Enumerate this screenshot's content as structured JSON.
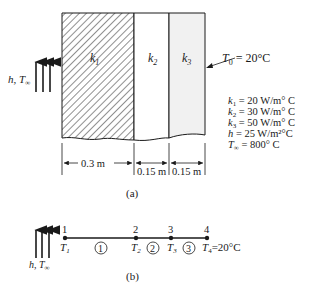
{
  "figure_a": {
    "caption": "(a)",
    "convection_label": "h, T",
    "convection_sub": "∞",
    "layers": [
      {
        "label": "k",
        "sub": "1",
        "thickness": "0.3 m",
        "fill": "hatched"
      },
      {
        "label": "k",
        "sub": "2",
        "thickness": "0.15 m",
        "fill": "white"
      },
      {
        "label": "k",
        "sub": "3",
        "thickness": "0.15 m",
        "fill": "light-gray"
      }
    ],
    "boundary_label": "T",
    "boundary_sub": "0",
    "boundary_value": " = 20°C",
    "properties": [
      {
        "sym": "k",
        "sub": "1",
        "text": " = 20 W/m° C"
      },
      {
        "sym": "k",
        "sub": "2",
        "text": " = 30 W/m° C"
      },
      {
        "sym": "k",
        "sub": "3",
        "text": " = 50 W/m° C"
      },
      {
        "sym": "h",
        "sub": "",
        "text": "  = 25 W/m²°C"
      },
      {
        "sym": "T",
        "sub": "∞",
        "text": " = 800° C"
      }
    ]
  },
  "figure_b": {
    "caption": "(b)",
    "convection_label": "h,  T",
    "convection_sub": "∞",
    "nodes": [
      {
        "number": "1",
        "temp": "T",
        "sub": "1"
      },
      {
        "number": "2",
        "temp": "T",
        "sub": "2"
      },
      {
        "number": "3",
        "temp": "T",
        "sub": "3"
      },
      {
        "number": "4",
        "temp": "T",
        "sub": "4"
      }
    ],
    "elements": [
      "1",
      "2",
      "3"
    ],
    "end_value": "=20°C"
  }
}
